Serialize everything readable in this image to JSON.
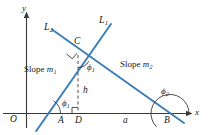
{
  "figure": {
    "colors": {
      "line": "#3B7EB8",
      "axis": "#3a3a3a",
      "text": "#1a1a1a",
      "background": "#ffffff"
    },
    "axes": {
      "x_label": "x",
      "y_label": "y",
      "origin_label": "O"
    },
    "lines": [
      {
        "name": "L1",
        "label": "L",
        "sub": "1",
        "slope_label": "Slope",
        "slope_var": "m",
        "slope_sub": "1"
      },
      {
        "name": "L2",
        "label": "L",
        "sub": "2",
        "slope_label": "Slope",
        "slope_var": "m",
        "slope_sub": "2"
      }
    ],
    "labels": {
      "line1": "L",
      "line1_sub": "1",
      "line2": "L",
      "line2_sub": "2",
      "slope1_text": "Slope",
      "slope1_var": "m",
      "slope1_sub": "1",
      "slope2_text": "Slope",
      "slope2_var": "m",
      "slope2_sub": "2",
      "point_c": "C",
      "point_a": "A",
      "point_b": "B",
      "point_d": "D",
      "point_o": "O",
      "height_h": "h",
      "base_a": "a",
      "axis_x": "x",
      "axis_y": "y",
      "phi_at_a": "ϕ",
      "phi_at_a_sub": "1",
      "phi_at_c": "ϕ",
      "phi_at_c_sub": "1",
      "phi_at_b": "ϕ",
      "phi_at_b_sub": "2"
    }
  }
}
